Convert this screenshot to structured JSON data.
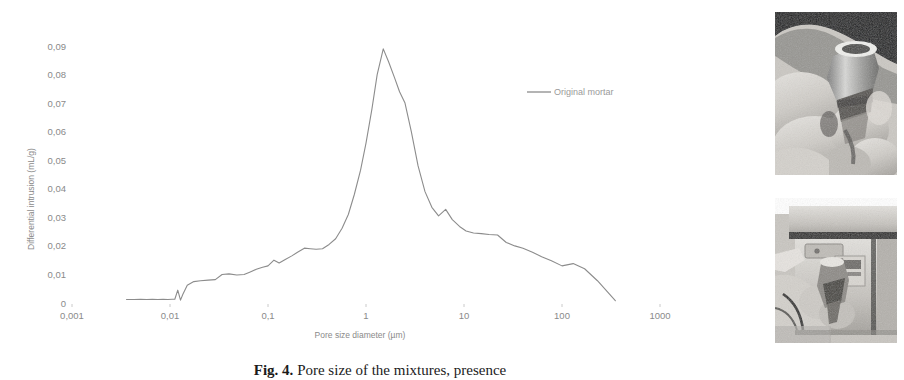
{
  "figure": {
    "caption_prefix": "Fig. 4.",
    "caption_text": "Pore size of the mixtures, presence"
  },
  "chart_data": {
    "type": "line",
    "title": "",
    "xlabel": "Pore size diameter (µm)",
    "ylabel": "Differential intrusion (mL/g)",
    "xscale": "log",
    "xlim": [
      0.001,
      1000
    ],
    "ylim": [
      0,
      0.095
    ],
    "xticks": [
      "0,001",
      "0,01",
      "0,1",
      "1",
      "10",
      "100",
      "1000"
    ],
    "xtick_values": [
      0.001,
      0.01,
      0.1,
      1,
      10,
      100,
      1000
    ],
    "yticks": [
      "0",
      "0,01",
      "0,02",
      "0,03",
      "0,04",
      "0,05",
      "0,06",
      "0,07",
      "0,08",
      "0,09"
    ],
    "ytick_values": [
      0,
      0.01,
      0.02,
      0.03,
      0.04,
      0.05,
      0.06,
      0.07,
      0.08,
      0.09
    ],
    "grid": false,
    "legend_position": "upper-right",
    "series": [
      {
        "name": "Original mortar",
        "color": "#8c8c8c",
        "x": [
          0.0036,
          0.0043,
          0.005,
          0.0058,
          0.0066,
          0.0075,
          0.0085,
          0.0095,
          0.0105,
          0.0112,
          0.012,
          0.0128,
          0.0135,
          0.015,
          0.0175,
          0.0205,
          0.0245,
          0.029,
          0.034,
          0.04,
          0.048,
          0.057,
          0.065,
          0.076,
          0.088,
          0.1,
          0.115,
          0.13,
          0.15,
          0.175,
          0.2,
          0.235,
          0.27,
          0.31,
          0.36,
          0.42,
          0.49,
          0.57,
          0.66,
          0.76,
          0.88,
          1.0,
          1.15,
          1.3,
          1.5,
          1.7,
          1.95,
          2.2,
          2.5,
          2.9,
          3.4,
          4.0,
          4.7,
          5.5,
          6.5,
          7.6,
          9.0,
          10.5,
          12.5,
          15.0,
          18.0,
          22.0,
          27.0,
          33.0,
          40.0,
          50.0,
          62.0,
          78.0,
          100.0,
          130.0,
          170.0,
          230.0,
          350.0
        ],
        "y": [
          0.0012,
          0.0012,
          0.0013,
          0.0012,
          0.0013,
          0.0012,
          0.0013,
          0.0012,
          0.0013,
          0.0013,
          0.0045,
          0.001,
          0.003,
          0.0062,
          0.0075,
          0.0078,
          0.008,
          0.0082,
          0.01,
          0.0102,
          0.0098,
          0.01,
          0.0108,
          0.0118,
          0.0125,
          0.013,
          0.015,
          0.014,
          0.0152,
          0.0165,
          0.0178,
          0.0192,
          0.019,
          0.0188,
          0.019,
          0.0205,
          0.0225,
          0.0262,
          0.031,
          0.038,
          0.0465,
          0.056,
          0.068,
          0.08,
          0.089,
          0.0845,
          0.079,
          0.074,
          0.07,
          0.06,
          0.048,
          0.039,
          0.0335,
          0.0305,
          0.0328,
          0.0292,
          0.0268,
          0.0252,
          0.0245,
          0.0243,
          0.024,
          0.0238,
          0.0212,
          0.02,
          0.0192,
          0.0178,
          0.0162,
          0.0148,
          0.013,
          0.0138,
          0.012,
          0.0078,
          0.0008
        ]
      }
    ],
    "legend": [
      "Original mortar"
    ]
  },
  "photos": [
    {
      "name": "penetrometer-in-hand",
      "description": "Gloved hands holding a glass penetrometer sample holder"
    },
    {
      "name": "penetrometer-in-porosimeter",
      "description": "Gloved hand inserting the penetrometer into the mercury porosimeter"
    }
  ]
}
